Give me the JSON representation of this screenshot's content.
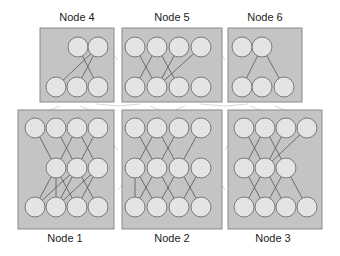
{
  "diagram": {
    "title": "",
    "colors": {
      "box_fill": "#c4c4c4",
      "box_stroke": "#8a8a8a",
      "neuron_fill": "#e4e4e4",
      "neuron_stroke": "#7a7a7a",
      "edge": "#555555",
      "cross_edge": "#d8d8d8"
    },
    "nodes": [
      {
        "id": "node4",
        "label": "Node 4",
        "box": {
          "x": 40,
          "y": 28,
          "w": 74,
          "h": 74
        },
        "label_pos": {
          "x": 77,
          "y": 21
        },
        "layers": [
          [
            [
              78,
              47
            ],
            [
              98,
              47
            ]
          ],
          [
            [
              56,
              87
            ],
            [
              77,
              87
            ],
            [
              98,
              87
            ]
          ]
        ],
        "edges": [
          [
            [
              0,
              0
            ],
            [
              1,
              2
            ]
          ],
          [
            [
              0,
              1
            ],
            [
              1,
              0
            ]
          ],
          [
            [
              0,
              1
            ],
            [
              1,
              1
            ]
          ]
        ]
      },
      {
        "id": "node5",
        "label": "Node 5",
        "box": {
          "x": 122,
          "y": 28,
          "w": 100,
          "h": 74
        },
        "label_pos": {
          "x": 172,
          "y": 21
        },
        "layers": [
          [
            [
              135,
              47
            ],
            [
              157,
              47
            ],
            [
              179,
              47
            ],
            [
              201,
              47
            ]
          ],
          [
            [
              135,
              87
            ],
            [
              157,
              87
            ],
            [
              179,
              87
            ],
            [
              201,
              87
            ]
          ]
        ],
        "edges": [
          [
            [
              0,
              0
            ],
            [
              1,
              1
            ]
          ],
          [
            [
              0,
              1
            ],
            [
              1,
              0
            ]
          ],
          [
            [
              0,
              1
            ],
            [
              1,
              2
            ]
          ],
          [
            [
              0,
              2
            ],
            [
              1,
              1
            ]
          ],
          [
            [
              0,
              3
            ],
            [
              1,
              1
            ]
          ]
        ]
      },
      {
        "id": "node6",
        "label": "Node 6",
        "box": {
          "x": 228,
          "y": 28,
          "w": 74,
          "h": 74
        },
        "label_pos": {
          "x": 265,
          "y": 21
        },
        "layers": [
          [
            [
              242,
              47
            ],
            [
              262,
              47
            ]
          ],
          [
            [
              242,
              87
            ],
            [
              262,
              87
            ],
            [
              284,
              87
            ]
          ]
        ],
        "edges": [
          [
            [
              0,
              1
            ],
            [
              1,
              0
            ]
          ],
          [
            [
              0,
              1
            ],
            [
              1,
              2
            ]
          ]
        ]
      },
      {
        "id": "node1",
        "label": "Node 1",
        "box": {
          "x": 18,
          "y": 110,
          "w": 96,
          "h": 119
        },
        "label_pos": {
          "x": 65,
          "y": 242
        },
        "layers": [
          [
            [
              35,
              128
            ],
            [
              56,
              128
            ],
            [
              77,
              128
            ],
            [
              98,
              128
            ]
          ],
          [
            [
              56,
              168
            ],
            [
              77,
              168
            ],
            [
              98,
              168
            ]
          ],
          [
            [
              35,
              207
            ],
            [
              56,
              207
            ],
            [
              77,
              207
            ],
            [
              98,
              207
            ]
          ]
        ],
        "edges": [
          [
            [
              0,
              0
            ],
            [
              1,
              0
            ]
          ],
          [
            [
              0,
              1
            ],
            [
              1,
              1
            ]
          ],
          [
            [
              0,
              2
            ],
            [
              1,
              0
            ]
          ],
          [
            [
              0,
              2
            ],
            [
              1,
              2
            ]
          ],
          [
            [
              0,
              3
            ],
            [
              1,
              1
            ]
          ],
          [
            [
              1,
              0
            ],
            [
              2,
              0
            ]
          ],
          [
            [
              1,
              0
            ],
            [
              2,
              1
            ]
          ],
          [
            [
              1,
              0
            ],
            [
              2,
              2
            ]
          ],
          [
            [
              1,
              1
            ],
            [
              2,
              0
            ]
          ],
          [
            [
              1,
              1
            ],
            [
              2,
              1
            ]
          ],
          [
            [
              1,
              1
            ],
            [
              2,
              3
            ]
          ],
          [
            [
              1,
              2
            ],
            [
              2,
              1
            ]
          ],
          [
            [
              1,
              2
            ],
            [
              2,
              2
            ]
          ]
        ]
      },
      {
        "id": "node2",
        "label": "Node 2",
        "box": {
          "x": 122,
          "y": 110,
          "w": 100,
          "h": 119
        },
        "label_pos": {
          "x": 172,
          "y": 242
        },
        "layers": [
          [
            [
              135,
              128
            ],
            [
              157,
              128
            ],
            [
              179,
              128
            ],
            [
              201,
              128
            ]
          ],
          [
            [
              135,
              168
            ],
            [
              157,
              168
            ],
            [
              179,
              168
            ],
            [
              201,
              168
            ]
          ],
          [
            [
              135,
              207
            ],
            [
              157,
              207
            ],
            [
              179,
              207
            ],
            [
              201,
              207
            ]
          ]
        ],
        "edges": [
          [
            [
              0,
              0
            ],
            [
              1,
              1
            ]
          ],
          [
            [
              0,
              1
            ],
            [
              1,
              0
            ]
          ],
          [
            [
              0,
              1
            ],
            [
              1,
              2
            ]
          ],
          [
            [
              0,
              2
            ],
            [
              1,
              1
            ]
          ],
          [
            [
              0,
              3
            ],
            [
              1,
              2
            ]
          ],
          [
            [
              1,
              0
            ],
            [
              2,
              0
            ]
          ],
          [
            [
              1,
              0
            ],
            [
              2,
              1
            ]
          ],
          [
            [
              1,
              1
            ],
            [
              2,
              0
            ]
          ],
          [
            [
              1,
              1
            ],
            [
              2,
              2
            ]
          ],
          [
            [
              1,
              2
            ],
            [
              2,
              1
            ]
          ],
          [
            [
              1,
              2
            ],
            [
              2,
              3
            ]
          ],
          [
            [
              1,
              3
            ],
            [
              2,
              2
            ]
          ]
        ]
      },
      {
        "id": "node3",
        "label": "Node 3",
        "box": {
          "x": 228,
          "y": 110,
          "w": 94,
          "h": 119
        },
        "label_pos": {
          "x": 273,
          "y": 242
        },
        "layers": [
          [
            [
              244,
              128
            ],
            [
              265,
              128
            ],
            [
              286,
              128
            ],
            [
              307,
              128
            ]
          ],
          [
            [
              244,
              168
            ],
            [
              265,
              168
            ],
            [
              286,
              168
            ]
          ],
          [
            [
              244,
              207
            ],
            [
              265,
              207
            ],
            [
              286,
              207
            ],
            [
              307,
              207
            ]
          ]
        ],
        "edges": [
          [
            [
              0,
              0
            ],
            [
              1,
              1
            ]
          ],
          [
            [
              0,
              1
            ],
            [
              1,
              0
            ]
          ],
          [
            [
              0,
              1
            ],
            [
              1,
              2
            ]
          ],
          [
            [
              0,
              2
            ],
            [
              1,
              1
            ]
          ],
          [
            [
              0,
              3
            ],
            [
              1,
              1
            ]
          ],
          [
            [
              1,
              0
            ],
            [
              2,
              1
            ]
          ],
          [
            [
              1,
              1
            ],
            [
              2,
              0
            ]
          ],
          [
            [
              1,
              1
            ],
            [
              2,
              2
            ]
          ],
          [
            [
              1,
              2
            ],
            [
              2,
              1
            ]
          ],
          [
            [
              1,
              2
            ],
            [
              2,
              3
            ]
          ]
        ]
      }
    ],
    "cross_edges": [
      [
        [
          118,
          106
        ],
        [
          140,
          104
        ]
      ],
      [
        [
          118,
          106
        ],
        [
          96,
          104
        ]
      ],
      [
        [
          225,
          106
        ],
        [
          200,
          104
        ]
      ],
      [
        [
          225,
          106
        ],
        [
          248,
          104
        ]
      ],
      [
        [
          60,
          106
        ],
        [
          50,
          110
        ]
      ],
      [
        [
          80,
          106
        ],
        [
          90,
          110
        ]
      ],
      [
        [
          150,
          106
        ],
        [
          160,
          110
        ]
      ],
      [
        [
          185,
          106
        ],
        [
          175,
          110
        ]
      ],
      [
        [
          250,
          106
        ],
        [
          260,
          110
        ]
      ],
      [
        [
          275,
          106
        ],
        [
          285,
          110
        ]
      ],
      [
        [
          118,
          60
        ],
        [
          114,
          55
        ]
      ],
      [
        [
          118,
          150
        ],
        [
          114,
          145
        ]
      ],
      [
        [
          118,
          190
        ],
        [
          122,
          185
        ]
      ],
      [
        [
          225,
          60
        ],
        [
          222,
          55
        ]
      ],
      [
        [
          225,
          150
        ],
        [
          228,
          145
        ]
      ],
      [
        [
          225,
          190
        ],
        [
          222,
          185
        ]
      ]
    ]
  }
}
